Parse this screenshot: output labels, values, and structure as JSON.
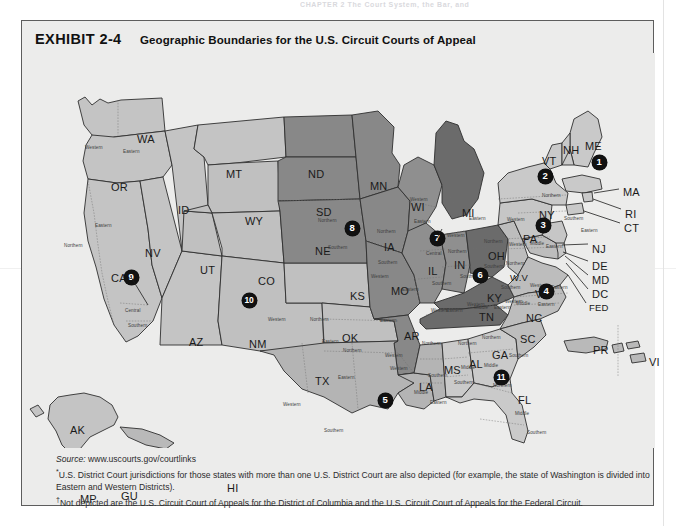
{
  "running_head": "CHAPTER 2   The Court System, the Bar, and",
  "exhibit": {
    "number_label": "EXHIBIT 2-4",
    "title": "Geographic Boundaries for the U.S. Circuit Courts of Appeal"
  },
  "colors": {
    "panel_bg": "#ececeb",
    "circuit_1_3": "#c9c9c9",
    "circuit_4": "#bdbdbd",
    "circuit_5": "#b5b5b5",
    "circuit_6": "#6a6a6a",
    "circuit_7": "#8e8e8e",
    "circuit_8": "#8a8a8a",
    "circuit_9": "#c4c4c4",
    "circuit_10": "#c0c0c0",
    "circuit_11": "#c9c9c9",
    "marker_fill": "#111111",
    "marker_text": "#ffffff",
    "border": "#5d5d5d"
  },
  "markers": [
    {
      "label": "1",
      "x": 577,
      "y": 109
    },
    {
      "label": "2",
      "x": 523,
      "y": 123
    },
    {
      "label": "3",
      "x": 521,
      "y": 172
    },
    {
      "label": "4",
      "x": 524,
      "y": 238
    },
    {
      "label": "5",
      "x": 363,
      "y": 347
    },
    {
      "label": "6",
      "x": 458,
      "y": 222
    },
    {
      "label": "7",
      "x": 415,
      "y": 185
    },
    {
      "label": "8",
      "x": 330,
      "y": 175
    },
    {
      "label": "9",
      "x": 109,
      "y": 224
    },
    {
      "label": "10",
      "x": 227,
      "y": 247
    },
    {
      "label": "11",
      "x": 479,
      "y": 324
    }
  ],
  "states": [
    {
      "abbr": "WA",
      "x": 115,
      "y": 80
    },
    {
      "abbr": "OR",
      "x": 89,
      "y": 128
    },
    {
      "abbr": "ID",
      "x": 156,
      "y": 151
    },
    {
      "abbr": "MT",
      "x": 204,
      "y": 115
    },
    {
      "abbr": "ND",
      "x": 286,
      "y": 115
    },
    {
      "abbr": "SD",
      "x": 294,
      "y": 153
    },
    {
      "abbr": "NE",
      "x": 293,
      "y": 192
    },
    {
      "abbr": "WY",
      "x": 223,
      "y": 162
    },
    {
      "abbr": "NV",
      "x": 123,
      "y": 194
    },
    {
      "abbr": "UT",
      "x": 178,
      "y": 211
    },
    {
      "abbr": "CO",
      "x": 236,
      "y": 222
    },
    {
      "abbr": "CA",
      "x": 89,
      "y": 219
    },
    {
      "abbr": "AZ",
      "x": 167,
      "y": 283
    },
    {
      "abbr": "NM",
      "x": 227,
      "y": 285
    },
    {
      "abbr": "KS",
      "x": 328,
      "y": 237
    },
    {
      "abbr": "OK",
      "x": 320,
      "y": 279
    },
    {
      "abbr": "TX",
      "x": 293,
      "y": 322
    },
    {
      "abbr": "MN",
      "x": 348,
      "y": 127
    },
    {
      "abbr": "IA",
      "x": 362,
      "y": 188
    },
    {
      "abbr": "MO",
      "x": 369,
      "y": 232
    },
    {
      "abbr": "AR",
      "x": 382,
      "y": 277
    },
    {
      "abbr": "LA",
      "x": 397,
      "y": 328
    },
    {
      "abbr": "MS",
      "x": 422,
      "y": 311
    },
    {
      "abbr": "AL",
      "x": 447,
      "y": 305
    },
    {
      "abbr": "WI",
      "x": 389,
      "y": 148
    },
    {
      "abbr": "IL",
      "x": 406,
      "y": 212
    },
    {
      "abbr": "IN",
      "x": 432,
      "y": 206
    },
    {
      "abbr": "MI",
      "x": 440,
      "y": 154
    },
    {
      "abbr": "OH",
      "x": 466,
      "y": 197
    },
    {
      "abbr": "KY",
      "x": 465,
      "y": 239
    },
    {
      "abbr": "TN",
      "x": 457,
      "y": 258
    },
    {
      "abbr": "GA",
      "x": 470,
      "y": 296
    },
    {
      "abbr": "FL",
      "x": 496,
      "y": 341
    },
    {
      "abbr": "SC",
      "x": 498,
      "y": 280
    },
    {
      "abbr": "NC",
      "x": 504,
      "y": 259
    },
    {
      "abbr": "VA",
      "x": 513,
      "y": 235
    },
    {
      "abbr": "W.V",
      "x": 488,
      "y": 219
    },
    {
      "abbr": "PA",
      "x": 501,
      "y": 180
    },
    {
      "abbr": "NY",
      "x": 517,
      "y": 156
    },
    {
      "abbr": "VT",
      "x": 520,
      "y": 102
    },
    {
      "abbr": "NH",
      "x": 541,
      "y": 91
    },
    {
      "abbr": "ME",
      "x": 563,
      "y": 87
    },
    {
      "abbr": "MA",
      "x": 601,
      "y": 133
    },
    {
      "abbr": "RI",
      "x": 603,
      "y": 155
    },
    {
      "abbr": "CT",
      "x": 602,
      "y": 169
    },
    {
      "abbr": "NJ",
      "x": 570,
      "y": 190
    },
    {
      "abbr": "DE",
      "x": 570,
      "y": 207
    },
    {
      "abbr": "MD",
      "x": 570,
      "y": 221
    },
    {
      "abbr": "DC",
      "x": 570,
      "y": 235
    },
    {
      "abbr": "FED",
      "x": 567,
      "y": 249
    },
    {
      "abbr": "AK",
      "x": 48,
      "y": 371
    },
    {
      "abbr": "HI",
      "x": 205,
      "y": 429
    },
    {
      "abbr": "MP",
      "x": 58,
      "y": 440
    },
    {
      "abbr": "GU",
      "x": 99,
      "y": 437
    },
    {
      "abbr": "PR",
      "x": 571,
      "y": 291
    },
    {
      "abbr": "VI",
      "x": 627,
      "y": 303
    }
  ],
  "districts": [
    {
      "label": "Western",
      "x": 63,
      "y": 92
    },
    {
      "label": "Eastern",
      "x": 101,
      "y": 96
    },
    {
      "label": "Eastern",
      "x": 73,
      "y": 170
    },
    {
      "label": "Northern",
      "x": 42,
      "y": 190
    },
    {
      "label": "Central",
      "x": 103,
      "y": 255
    },
    {
      "label": "Southern",
      "x": 106,
      "y": 270
    },
    {
      "label": "Northern",
      "x": 296,
      "y": 165
    },
    {
      "label": "Southern",
      "x": 306,
      "y": 192
    },
    {
      "label": "Northern",
      "x": 355,
      "y": 176
    },
    {
      "label": "Southern",
      "x": 356,
      "y": 207
    },
    {
      "label": "Western",
      "x": 246,
      "y": 264
    },
    {
      "label": "Northern",
      "x": 288,
      "y": 264
    },
    {
      "label": "Eastern",
      "x": 300,
      "y": 286
    },
    {
      "label": "Northern",
      "x": 321,
      "y": 295
    },
    {
      "label": "Eastern",
      "x": 316,
      "y": 322
    },
    {
      "label": "Western",
      "x": 261,
      "y": 349
    },
    {
      "label": "Southern",
      "x": 302,
      "y": 375
    },
    {
      "label": "Western",
      "x": 349,
      "y": 221
    },
    {
      "label": "Eastern",
      "x": 380,
      "y": 234
    },
    {
      "label": "Eastern",
      "x": 358,
      "y": 265
    },
    {
      "label": "Western",
      "x": 363,
      "y": 300
    },
    {
      "label": "Western",
      "x": 368,
      "y": 313
    },
    {
      "label": "Northern",
      "x": 400,
      "y": 288
    },
    {
      "label": "Southern",
      "x": 406,
      "y": 320
    },
    {
      "label": "Middle",
      "x": 392,
      "y": 337
    },
    {
      "label": "Eastern",
      "x": 408,
      "y": 347
    },
    {
      "label": "Northern",
      "x": 436,
      "y": 288
    },
    {
      "label": "Middle",
      "x": 439,
      "y": 312
    },
    {
      "label": "Southern",
      "x": 432,
      "y": 327
    },
    {
      "label": "Northern",
      "x": 460,
      "y": 282
    },
    {
      "label": "Middle",
      "x": 462,
      "y": 310
    },
    {
      "label": "Southern",
      "x": 487,
      "y": 300
    },
    {
      "label": "Northern",
      "x": 471,
      "y": 330
    },
    {
      "label": "Middle",
      "x": 493,
      "y": 358
    },
    {
      "label": "Southern",
      "x": 505,
      "y": 377
    },
    {
      "label": "Western",
      "x": 388,
      "y": 144
    },
    {
      "label": "Eastern",
      "x": 392,
      "y": 166
    },
    {
      "label": "Western",
      "x": 425,
      "y": 180
    },
    {
      "label": "Eastern",
      "x": 447,
      "y": 163
    },
    {
      "label": "Northern",
      "x": 426,
      "y": 196
    },
    {
      "label": "Central",
      "x": 404,
      "y": 198
    },
    {
      "label": "Southern",
      "x": 410,
      "y": 228
    },
    {
      "label": "Southern",
      "x": 438,
      "y": 221
    },
    {
      "label": "Northern",
      "x": 462,
      "y": 186
    },
    {
      "label": "Southern",
      "x": 462,
      "y": 211
    },
    {
      "label": "Western",
      "x": 445,
      "y": 249
    },
    {
      "label": "Eastern",
      "x": 472,
      "y": 252
    },
    {
      "label": "Middle",
      "x": 452,
      "y": 252
    },
    {
      "label": "Eastern",
      "x": 424,
      "y": 255
    },
    {
      "label": "Western",
      "x": 409,
      "y": 255
    },
    {
      "label": "Western",
      "x": 483,
      "y": 246
    },
    {
      "label": "Middle",
      "x": 494,
      "y": 248
    },
    {
      "label": "Eastern",
      "x": 516,
      "y": 249
    },
    {
      "label": "Northern",
      "x": 484,
      "y": 208
    },
    {
      "label": "Southern",
      "x": 479,
      "y": 232
    },
    {
      "label": "Western",
      "x": 508,
      "y": 230
    },
    {
      "label": "Eastern",
      "x": 529,
      "y": 232
    },
    {
      "label": "Western",
      "x": 487,
      "y": 189
    },
    {
      "label": "Middle",
      "x": 508,
      "y": 188
    },
    {
      "label": "Eastern",
      "x": 524,
      "y": 191
    },
    {
      "label": "Western",
      "x": 485,
      "y": 164
    },
    {
      "label": "Northern",
      "x": 520,
      "y": 140
    },
    {
      "label": "Southern",
      "x": 542,
      "y": 163
    },
    {
      "label": "Eastern",
      "x": 559,
      "y": 175
    }
  ],
  "notes": {
    "source_label": "Source:",
    "source_value": "www.uscourts.gov/courtlinks",
    "footnote1_symbol": "*",
    "footnote1": "U.S. District Court jurisdictions for those states with more than one U.S. District Court are also depicted (for example, the state of Washington is divided into Eastern and Western Districts).",
    "footnote2_symbol": "†",
    "footnote2": "Not depicted are the U.S. Circuit Court of Appeals for the District of Columbia and the U.S. Circuit Court of Appeals for the Federal Circuit."
  }
}
